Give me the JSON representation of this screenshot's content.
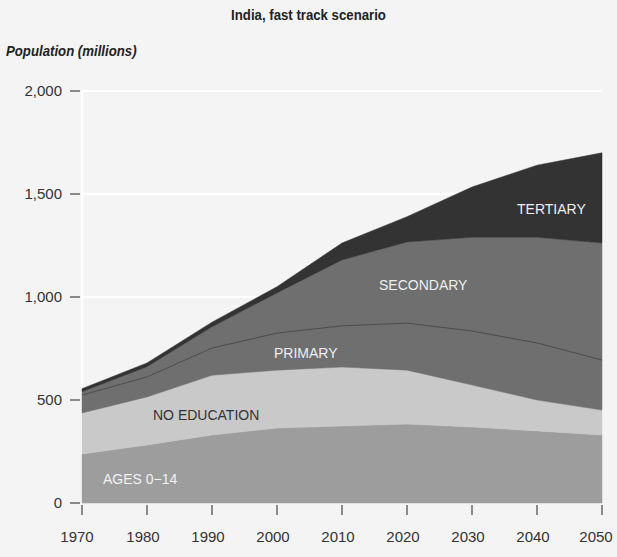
{
  "chart_data": {
    "type": "area",
    "stacked": true,
    "title": "India, fast track scenario",
    "ylabel": "Population (millions)",
    "xlabel": "",
    "x": [
      1970,
      1980,
      1990,
      2000,
      2010,
      2020,
      2030,
      2040,
      2050
    ],
    "xticks": [
      "1970",
      "1980",
      "1990",
      "2000",
      "2010",
      "2020",
      "2030",
      "2040",
      "2050"
    ],
    "yticks": [
      "0",
      "500",
      "1,000",
      "1,500",
      "2,000"
    ],
    "ylim": [
      0,
      2000
    ],
    "series": [
      {
        "name": "AGES 0–14",
        "color": "#9d9d9d",
        "values": [
          238,
          282,
          330,
          364,
          374,
          383,
          369,
          350,
          330
        ]
      },
      {
        "name": "NO EDUCATION",
        "color": "#c9c9c9",
        "values": [
          199,
          233,
          290,
          281,
          286,
          262,
          204,
          150,
          121
        ]
      },
      {
        "name": "PRIMARY",
        "color": "#6f6f6f",
        "values": [
          87,
          97,
          132,
          180,
          200,
          228,
          262,
          277,
          243
        ]
      },
      {
        "name": "SECONDARY",
        "color": "#6f6f6f",
        "values": [
          16,
          50,
          103,
          195,
          320,
          394,
          455,
          513,
          568
        ]
      },
      {
        "name": "TERTIARY",
        "color": "#333333",
        "values": [
          15,
          18,
          23,
          30,
          82,
          123,
          244,
          350,
          438
        ]
      }
    ],
    "totals": [
      555,
      680,
      878,
      1050,
      1262,
      1390,
      1534,
      1640,
      1700
    ],
    "grid": false,
    "legend": "inline labels"
  },
  "labels": {
    "title": "India, fast track scenario",
    "ylabel": "Population (millions)",
    "ages": "AGES 0−14",
    "noed": "NO EDUCATION",
    "primary": "PRIMARY",
    "secondary": "SECONDARY",
    "tertiary": "TERTIARY",
    "y0": "0",
    "y500": "500",
    "y1000": "1,000",
    "y1500": "1,500",
    "y2000": "2,000",
    "x1970": "1970",
    "x1980": "1980",
    "x1990": "1990",
    "x2000": "2000",
    "x2010": "2010",
    "x2020": "2020",
    "x2030": "2030",
    "x2040": "2040",
    "x2050": "2050"
  }
}
